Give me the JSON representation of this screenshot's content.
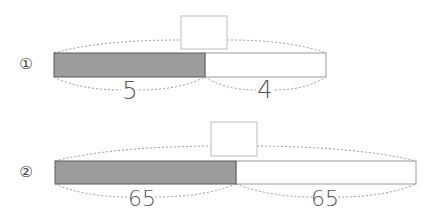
{
  "problems": [
    {
      "marker": "①",
      "left_label": "5",
      "right_label": "4",
      "answer_box": "",
      "bar": {
        "x": 54,
        "y": 53,
        "w": 272,
        "h": 24,
        "split": 205
      },
      "box": {
        "x": 181,
        "y": 16,
        "w": 46,
        "h": 33
      }
    },
    {
      "marker": "②",
      "left_label": "65",
      "right_label": "65",
      "answer_box": "",
      "bar": {
        "x": 55,
        "y": 161,
        "w": 361,
        "h": 23,
        "split": 236
      },
      "box": {
        "x": 211,
        "y": 122,
        "w": 46,
        "h": 34
      }
    }
  ],
  "colors": {
    "shaded_fill": "#9c9c9c",
    "shaded_border": "#5a5a5a",
    "plain_border": "#9a9a9a",
    "dashed": "#9a9a9a",
    "box_border": "#bdbdbd",
    "text": "#555555"
  }
}
